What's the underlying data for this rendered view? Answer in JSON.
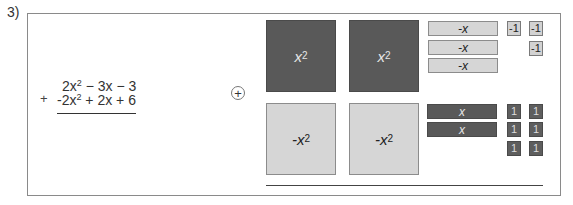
{
  "problem": {
    "number_label": "3)",
    "operation_sign": "+",
    "addend_1": {
      "coef2": "2x",
      "exp": "2",
      "rest": " − 3x − 3"
    },
    "addend_2": {
      "coef2": "-2x",
      "exp": "2",
      "rest": " + 2x + 6"
    },
    "addend_1_text": "2x² − 3x − 3",
    "addend_2_text": "-2x² + 2x + 6",
    "combine_symbol": "+"
  },
  "algebra_tiles": {
    "squares": [
      {
        "label": "x",
        "exp": "2",
        "sign": "positive"
      },
      {
        "label": "x",
        "exp": "2",
        "sign": "positive"
      },
      {
        "label": "-x",
        "exp": "2",
        "sign": "negative"
      },
      {
        "label": "-x",
        "exp": "2",
        "sign": "negative"
      }
    ],
    "x_bars": [
      {
        "label": "-x",
        "sign": "negative"
      },
      {
        "label": "-x",
        "sign": "negative"
      },
      {
        "label": "-x",
        "sign": "negative"
      },
      {
        "label": "x",
        "sign": "positive"
      },
      {
        "label": "x",
        "sign": "positive"
      }
    ],
    "unit_tiles": [
      {
        "label": "-1",
        "sign": "negative"
      },
      {
        "label": "-1",
        "sign": "negative"
      },
      {
        "label": "-1",
        "sign": "negative"
      },
      {
        "label": "1",
        "sign": "positive"
      },
      {
        "label": "1",
        "sign": "positive"
      },
      {
        "label": "1",
        "sign": "positive"
      },
      {
        "label": "1",
        "sign": "positive"
      },
      {
        "label": "1",
        "sign": "positive"
      },
      {
        "label": "1",
        "sign": "positive"
      }
    ],
    "colors": {
      "positive": "#595959",
      "negative": "#d6d6d6"
    }
  }
}
